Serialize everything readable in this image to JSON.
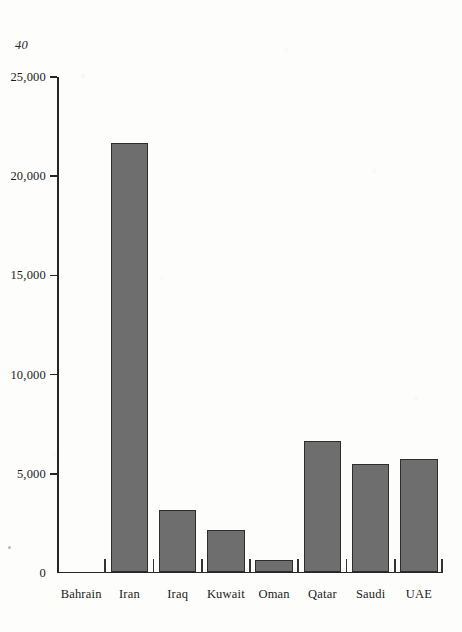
{
  "page": {
    "number": "40"
  },
  "chart_data": {
    "type": "bar",
    "title": "",
    "subtitle": "",
    "xlabel": "",
    "ylabel": "",
    "categories": [
      "Bahrain",
      "Iran",
      "Iraq",
      "Kuwait",
      "Oman",
      "Qatar",
      "Saudi",
      "UAE"
    ],
    "values": [
      0,
      21600,
      3100,
      2100,
      600,
      6600,
      5400,
      5650
    ],
    "ylim": [
      0,
      25000
    ],
    "yticks": [
      0,
      5000,
      10000,
      15000,
      20000,
      25000
    ],
    "ytick_labels": [
      "0",
      "5,000",
      "10,000",
      "15,000",
      "20,000",
      "25,000"
    ],
    "grid": false,
    "legend": null,
    "bar_fill_color": "#6e6e6e",
    "bar_edge_color": "#2e2e2e",
    "axis_color": "#262626",
    "background_color": "#fdfdfb"
  }
}
